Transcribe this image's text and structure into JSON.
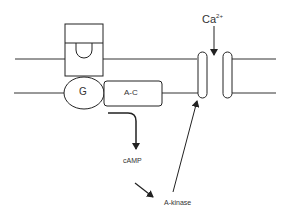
{
  "diagram": {
    "title": "",
    "labels": {
      "g_protein": "G",
      "adenylate_cyclase": "A-C",
      "calcium_ion": "Ca",
      "calcium_charge": "2+",
      "camp": "cAMP",
      "a_kinase": "A-kinase"
    },
    "colors": {
      "stroke": "#222222",
      "background": "#ffffff",
      "text": "#333333"
    }
  }
}
